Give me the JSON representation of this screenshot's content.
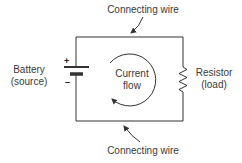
{
  "labels": {
    "top_wire": "Connecting wire",
    "bottom_wire": "Connecting wire",
    "battery_line1": "Battery",
    "battery_line2": "(source)",
    "resistor_line1": "Resistor",
    "resistor_line2": "(load)",
    "flow_line1": "Current",
    "flow_line2": "flow",
    "plus": "+",
    "minus": "–"
  },
  "components": [
    {
      "type": "battery",
      "role": "source",
      "polarity_top": "+",
      "polarity_bottom": "-"
    },
    {
      "type": "resistor",
      "role": "load"
    },
    {
      "type": "wire",
      "position": "top"
    },
    {
      "type": "wire",
      "position": "bottom"
    },
    {
      "type": "current-flow-arrow",
      "direction": "clockwise"
    }
  ],
  "colors": {
    "line": "#333333",
    "text": "#3a3a3a",
    "background": "#ffffff"
  }
}
